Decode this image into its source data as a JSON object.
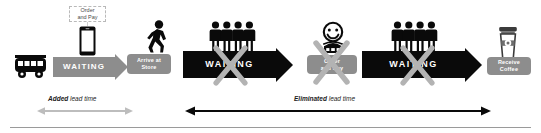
{
  "diagram": {
    "colors": {
      "grey": "#8d8d8d",
      "black": "#0a0a0a",
      "x_overlay": "#b0b0b0",
      "callout_border": "#b9b9b9",
      "rule": "#9a9a9a",
      "background": "#ffffff"
    },
    "steps": [
      {
        "id": "bus",
        "icon": "bus-icon",
        "label": ""
      },
      {
        "id": "order-callout",
        "icon": "smartphone-icon",
        "label": "Order\nand Pay"
      },
      {
        "id": "waiting-1",
        "icon": "arrow-right-icon",
        "label": "WAITING"
      },
      {
        "id": "arrive",
        "icon": "walking-person-icon",
        "label": "Arrive at\nStore"
      },
      {
        "id": "waiting-2",
        "icon": "queue-people-icon",
        "label": "WAITING"
      },
      {
        "id": "order-counter",
        "icon": "barista-icon",
        "label": "Order\nand Pay"
      },
      {
        "id": "waiting-3",
        "icon": "queue-people-icon",
        "label": "WAITING"
      },
      {
        "id": "receive",
        "icon": "coffee-cup-icon",
        "label": "Receive\nCoffee"
      }
    ],
    "callout": {
      "line1": "Order",
      "line2": "and Pay"
    },
    "pills": {
      "arrive_line1": "Arrive at",
      "arrive_line2": "Store",
      "order_line1": "Order",
      "order_line2": "and Pay",
      "receive_line1": "Receive",
      "receive_line2": "Coffee"
    },
    "arrow_labels": {
      "waiting_1": "WAITING",
      "waiting_2": "WAITING",
      "waiting_3": "WAITING"
    },
    "measures": [
      {
        "id": "added",
        "emphasis": "Added",
        "rest": "lead time",
        "style": "grey-double-headed",
        "x_start": 38,
        "x_end": 131
      },
      {
        "id": "eliminated",
        "emphasis": "Eliminated",
        "rest": "lead time",
        "style": "black-double-headed",
        "x_start": 186,
        "x_end": 489
      }
    ],
    "measure_text": {
      "added_bold": "Added",
      "added_rest": " lead time",
      "eliminated_bold": "Eliminated",
      "eliminated_rest": "  lead time"
    }
  }
}
